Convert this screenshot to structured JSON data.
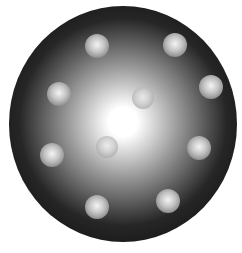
{
  "diagram": {
    "type": "plum-pudding-atom-model",
    "canvas": {
      "width": 242,
      "height": 253,
      "background": "#ffffff"
    },
    "sphere": {
      "cx": 123,
      "cy": 124,
      "rx": 114,
      "ry": 118,
      "highlight_cx": 123,
      "highlight_cy": 122,
      "colors": {
        "center": "#ffffff",
        "mid": "#9a9a9a",
        "edge": "#262626",
        "rim": "#1c1c1c"
      }
    },
    "particles": [
      {
        "id": "particle-1",
        "cx": 97,
        "cy": 46,
        "r": 12,
        "variant": "outer"
      },
      {
        "id": "particle-2",
        "cx": 175,
        "cy": 45,
        "r": 12,
        "variant": "outer"
      },
      {
        "id": "particle-3",
        "cx": 211,
        "cy": 87,
        "r": 12,
        "variant": "outer"
      },
      {
        "id": "particle-4",
        "cx": 59,
        "cy": 94,
        "r": 12,
        "variant": "outer"
      },
      {
        "id": "particle-5",
        "cx": 143,
        "cy": 98,
        "r": 11,
        "variant": "inner"
      },
      {
        "id": "particle-6",
        "cx": 107,
        "cy": 147,
        "r": 11,
        "variant": "inner"
      },
      {
        "id": "particle-7",
        "cx": 52,
        "cy": 155,
        "r": 12,
        "variant": "outer"
      },
      {
        "id": "particle-8",
        "cx": 199,
        "cy": 148,
        "r": 12,
        "variant": "outer"
      },
      {
        "id": "particle-9",
        "cx": 97,
        "cy": 207,
        "r": 12,
        "variant": "outer"
      },
      {
        "id": "particle-10",
        "cx": 168,
        "cy": 201,
        "r": 12,
        "variant": "outer"
      }
    ],
    "particle_colors": {
      "outer": {
        "highlight": "#f4f4f4",
        "body": "#c4c4c4",
        "edge": "#8e8e8e"
      },
      "inner": {
        "highlight": "#f0f0f0",
        "body": "#cfcfcf",
        "edge": "#a8a8a8"
      }
    }
  }
}
